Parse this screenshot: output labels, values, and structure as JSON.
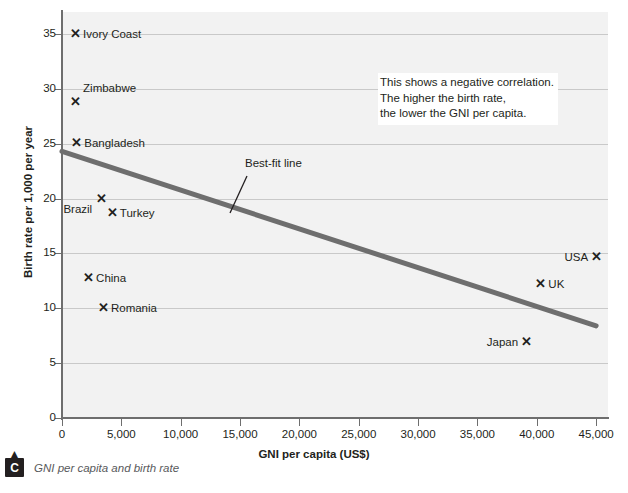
{
  "chart_data": {
    "type": "scatter",
    "title": "",
    "xlabel": "GNI per capita (US$)",
    "ylabel": "Birth rate per 1,000 per year",
    "xlim": [
      0,
      46000
    ],
    "ylim": [
      0,
      37
    ],
    "xticks": [
      0,
      5000,
      10000,
      15000,
      20000,
      25000,
      30000,
      35000,
      40000,
      45000
    ],
    "xticklabels": [
      "0",
      "5,000",
      "10,000",
      "15,000",
      "20,000",
      "25,000",
      "30,000",
      "35,000",
      "40,000",
      "45,000"
    ],
    "yticks": [
      0,
      5,
      10,
      15,
      20,
      25,
      30,
      35
    ],
    "yticklabels": [
      "0",
      "5",
      "10",
      "15",
      "20",
      "25",
      "30",
      "35"
    ],
    "grid": "horizontal",
    "legend": "none",
    "marker": "x",
    "points": [
      {
        "label": "Ivory Coast",
        "x": 1100,
        "y": 35.0,
        "label_pos": "right"
      },
      {
        "label": "Zimbabwe",
        "x": 1100,
        "y": 28.8,
        "label_pos": "above-right"
      },
      {
        "label": "Bangladesh",
        "x": 1200,
        "y": 25.1,
        "label_pos": "right"
      },
      {
        "label": "Brazil",
        "x": 3300,
        "y": 20.0,
        "label_pos": "below-left"
      },
      {
        "label": "Turkey",
        "x": 4200,
        "y": 18.7,
        "label_pos": "right"
      },
      {
        "label": "China",
        "x": 2200,
        "y": 12.8,
        "label_pos": "right"
      },
      {
        "label": "Romania",
        "x": 3450,
        "y": 10.0,
        "label_pos": "right"
      },
      {
        "label": "USA",
        "x": 45000,
        "y": 14.7,
        "label_pos": "left"
      },
      {
        "label": "UK",
        "x": 40300,
        "y": 12.2,
        "label_pos": "right"
      },
      {
        "label": "Japan",
        "x": 39100,
        "y": 6.9,
        "label_pos": "left"
      }
    ],
    "best_fit_line": {
      "label": "Best-fit line",
      "x_start": 0,
      "y_start": 24.3,
      "x_end": 45000,
      "y_end": 8.4,
      "color": "#6e6e6e"
    },
    "annotation": "This shows a negative correlation.\nThe higher the birth rate,\nthe lower the GNI per capita."
  },
  "caption": {
    "badge": "C",
    "chevron_icon": "caret-up-icon",
    "text": "GNI per capita and birth rate"
  },
  "colors": {
    "plot_background": "#f2f2f2",
    "gridline": "#c9c9c9",
    "axis": "#6e6e6e",
    "text": "#231f20",
    "trendline": "#6e6e6e",
    "caption_text": "#58595b"
  }
}
